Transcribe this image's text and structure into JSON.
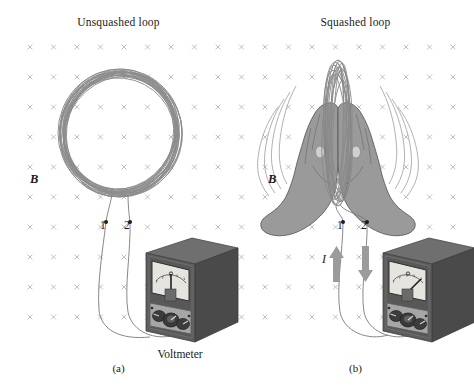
{
  "figure": {
    "background_color": "#ffffff",
    "width": 474,
    "height": 391
  },
  "panels": [
    {
      "id": "a",
      "title": "Unsquashed loop",
      "caption": "(a)",
      "field_label": "B",
      "terminal_1": "1",
      "terminal_2": "2",
      "device_label": "Voltmeter",
      "meter_reading": "zero",
      "loop_shape": "circular coil, many turns"
    },
    {
      "id": "b",
      "title": "Squashed loop",
      "caption": "(b)",
      "field_label": "B",
      "terminal_1": "1",
      "terminal_2": "2",
      "current_label": "I",
      "meter_reading": "deflected right",
      "loop_shape": "narrow vertical ellipse squashed by two hands"
    }
  ],
  "field_grid": {
    "symbol": "x",
    "meaning": "magnetic field into page",
    "color": "#b9b9b9",
    "columns": 19,
    "rows": 11,
    "x_start": 30,
    "y_start": 47,
    "x_step": 23.5,
    "y_step": 30
  },
  "colors": {
    "wire": "#8d8d8d",
    "wire_dark": "#6e6e6e",
    "hand_fill": "#9a9a9a",
    "hand_edge": "#5c5c5c",
    "meter_case_top": "#6f6f6f",
    "meter_case_front": "#5a5a5a",
    "meter_case_side": "#4a4a4a",
    "meter_dial": "#e3e1dc",
    "meter_lower_panel": "#a6a6a6",
    "knob": "#3a3a3a",
    "arrow": "#9b9b9b",
    "text": "#1a1a1a"
  }
}
